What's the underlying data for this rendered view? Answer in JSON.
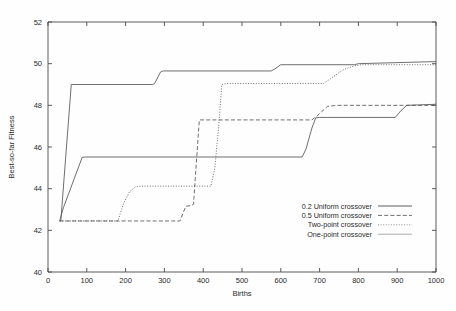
{
  "chart_data": {
    "type": "line",
    "title": "",
    "xlabel": "Births",
    "ylabel": "Best-so-far Fitness",
    "xlim": [
      0,
      1000
    ],
    "ylim": [
      40,
      52
    ],
    "xticks": [
      0,
      100,
      200,
      300,
      400,
      500,
      600,
      700,
      800,
      900,
      1000
    ],
    "yticks": [
      40,
      42,
      44,
      46,
      48,
      50,
      52
    ],
    "xtick_labels": [
      "0",
      "100",
      "200",
      "300",
      "400",
      "500",
      "600",
      "700",
      "800",
      "900",
      "1000"
    ],
    "ytick_labels": [
      "40",
      "42",
      "44",
      "46",
      "48",
      "50",
      "52"
    ],
    "grid": false,
    "legend_position": "lower right",
    "series": [
      {
        "name": "0.2 Uniform crossover",
        "style": "solid",
        "color": "#555555",
        "points": [
          [
            30,
            42.45
          ],
          [
            33,
            42.45
          ],
          [
            60,
            49.0
          ],
          [
            270,
            49.0
          ],
          [
            275,
            49.05
          ],
          [
            290,
            49.6
          ],
          [
            297,
            49.65
          ],
          [
            575,
            49.65
          ],
          [
            585,
            49.75
          ],
          [
            600,
            49.95
          ],
          [
            790,
            49.95
          ],
          [
            800,
            50.0
          ],
          [
            1000,
            50.1
          ]
        ]
      },
      {
        "name": "0.5 Uniform crossover",
        "style": "dashed",
        "color": "#555555",
        "points": [
          [
            30,
            42.45
          ],
          [
            180,
            42.45
          ],
          [
            185,
            42.45
          ],
          [
            340,
            42.45
          ],
          [
            355,
            43.15
          ],
          [
            370,
            43.2
          ],
          [
            375,
            43.25
          ],
          [
            390,
            47.3
          ],
          [
            680,
            47.3
          ],
          [
            690,
            47.45
          ],
          [
            700,
            47.6
          ],
          [
            720,
            47.95
          ],
          [
            745,
            48.0
          ],
          [
            995,
            48.0
          ],
          [
            1000,
            48.1
          ]
        ]
      },
      {
        "name": "Two-point crossover",
        "style": "dotted",
        "color": "#777777",
        "points": [
          [
            30,
            42.45
          ],
          [
            180,
            42.45
          ],
          [
            195,
            43.3
          ],
          [
            210,
            43.85
          ],
          [
            225,
            44.08
          ],
          [
            240,
            44.12
          ],
          [
            420,
            44.12
          ],
          [
            430,
            45.0
          ],
          [
            440,
            47.0
          ],
          [
            448,
            49.0
          ],
          [
            460,
            49.05
          ],
          [
            710,
            49.05
          ],
          [
            730,
            49.3
          ],
          [
            760,
            49.7
          ],
          [
            790,
            49.9
          ],
          [
            810,
            49.95
          ],
          [
            1000,
            49.95
          ]
        ]
      },
      {
        "name": "One-point crossover",
        "style": "solid-thin",
        "color": "#8a8a8a",
        "points": [
          [
            30,
            42.45
          ],
          [
            40,
            43.1
          ],
          [
            88,
            45.5
          ],
          [
            95,
            45.52
          ],
          [
            655,
            45.52
          ],
          [
            665,
            45.9
          ],
          [
            680,
            46.9
          ],
          [
            690,
            47.4
          ],
          [
            700,
            47.42
          ],
          [
            895,
            47.42
          ],
          [
            910,
            47.75
          ],
          [
            925,
            48.0
          ],
          [
            1000,
            48.05
          ]
        ]
      }
    ]
  },
  "legend": {
    "entries": [
      {
        "label": "0.2 Uniform crossover",
        "style": "solid"
      },
      {
        "label": "0.5 Uniform crossover",
        "style": "dashed"
      },
      {
        "label": "Two-point crossover",
        "style": "dotted"
      },
      {
        "label": "One-point crossover",
        "style": "solid-thin"
      }
    ]
  }
}
